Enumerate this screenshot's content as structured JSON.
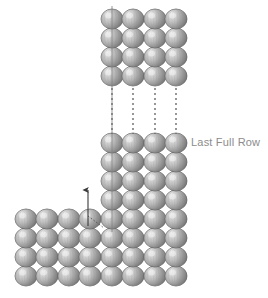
{
  "figure": {
    "title_text": "",
    "background_color": "#ffffff",
    "width": 268,
    "height": 298
  },
  "annotations": [
    {
      "name": "last-full-row-label",
      "text": "Last Full Row",
      "x": 191,
      "y": 137,
      "color": "#8c8c8c",
      "font_size": 11
    }
  ],
  "sphere_style": {
    "fill_light": "#e8e8e8",
    "fill_mid": "#b0b0b0",
    "fill_dark": "#6e6e6e",
    "stroke": "#5a5a5a",
    "highlight": "#f2f2f2",
    "radius_x": 11,
    "radius_y": 10
  },
  "line_style": {
    "dashed_color": "#6b6b6b",
    "solid_color": "#7a7a7a",
    "arrow_color": "#3a3a3a",
    "dash_pattern": "2,3"
  },
  "chart_data": {
    "type": "diagram",
    "column_x_positions": [
      112,
      133,
      155,
      176
    ],
    "column_gap_between": [
      2,
      3
    ],
    "groups": [
      {
        "name": "top-block",
        "rows": 4,
        "cols": 4,
        "row_y_positions": [
          19,
          38,
          57,
          76
        ],
        "col_x_positions": [
          112,
          133,
          155,
          176
        ]
      },
      {
        "name": "lower-block",
        "rows": 8,
        "cols": 4,
        "row_y_positions": [
          143,
          162,
          181,
          200,
          219,
          238,
          257,
          276
        ],
        "col_x_positions": [
          112,
          133,
          155,
          176
        ]
      },
      {
        "name": "bottom-left-block",
        "rows": 4,
        "cols": 4,
        "row_y_positions": [
          219,
          238,
          257,
          276
        ],
        "col_x_positions": [
          26,
          47,
          69,
          90
        ]
      }
    ],
    "dashed_connectors": [
      {
        "x": 112,
        "y1": 88,
        "y2": 134
      },
      {
        "x": 133,
        "y1": 88,
        "y2": 134
      },
      {
        "x": 155,
        "y1": 88,
        "y2": 134
      },
      {
        "x": 176,
        "y1": 88,
        "y2": 134
      }
    ],
    "registration_line": {
      "x": 112,
      "y1": 6,
      "y2": 232
    },
    "arrow": {
      "name": "insertion-arrow",
      "x": 88,
      "y_tip": 190,
      "y_tail": 226,
      "direction": "up",
      "dotted_leader": {
        "x1": 88,
        "y1": 216,
        "x2": 104,
        "y2": 228
      }
    },
    "labels": [
      "Last Full Row"
    ]
  }
}
